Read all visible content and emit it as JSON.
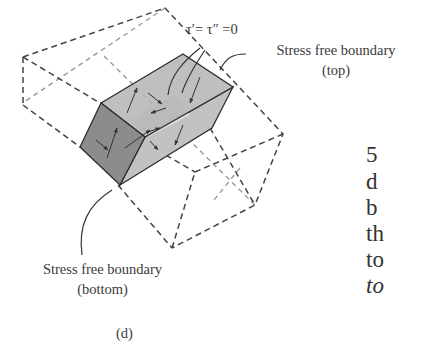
{
  "figure": {
    "panel_label": "(d)",
    "equation": "τ′= τ″ =0",
    "top_label": {
      "line1": "Stress free boundary",
      "line2": "(top)"
    },
    "bottom_label": {
      "line1": "Stress free boundary",
      "line2": "(bottom)"
    },
    "colors": {
      "dashed_outline": "#444444",
      "dashed_hidden": "#9a9a9a",
      "face_front": "#8c8c8c",
      "face_top": "#b4b4b4",
      "face_side": "#c2c2c2",
      "face_inner": "#dcdcdc",
      "arrow": "#333333"
    }
  },
  "body_text_fragments": [
    {
      "text": "5",
      "italic": false
    },
    {
      "text": "d",
      "italic": false
    },
    {
      "text": "b",
      "italic": false
    },
    {
      "text": "th",
      "italic": false
    },
    {
      "text": "to",
      "italic": false
    },
    {
      "text": "to",
      "italic": true
    }
  ]
}
